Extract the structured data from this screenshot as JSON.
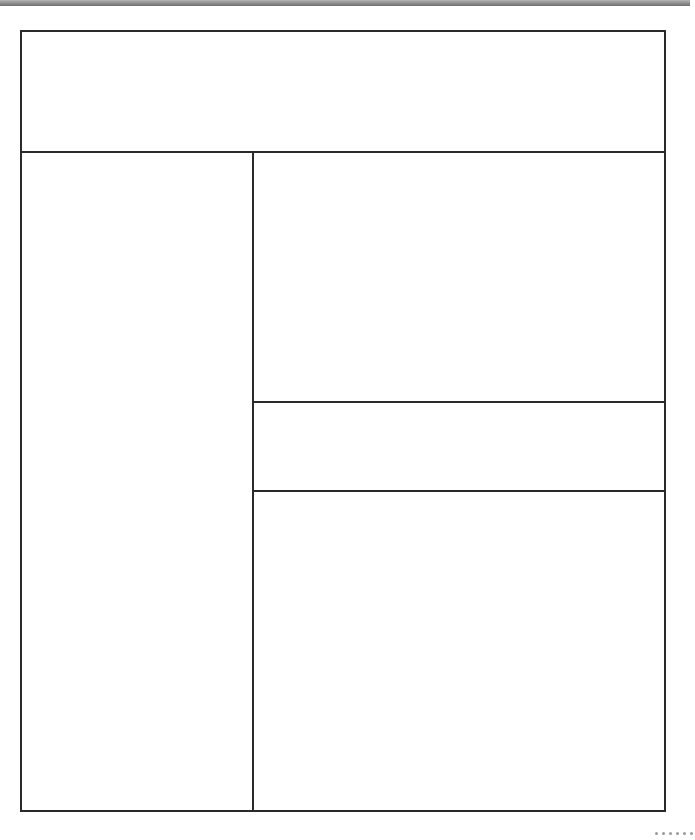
{
  "wireframe": {
    "colors": {
      "border": "#2a2a2a",
      "background": "#ffffff",
      "top_bar": "#8a8a8a"
    },
    "regions": [
      {
        "id": "header",
        "label": ""
      },
      {
        "id": "sidebar",
        "label": ""
      },
      {
        "id": "main-top",
        "label": ""
      },
      {
        "id": "main-middle",
        "label": ""
      },
      {
        "id": "main-bottom",
        "label": ""
      }
    ],
    "grip_dots": 6
  }
}
